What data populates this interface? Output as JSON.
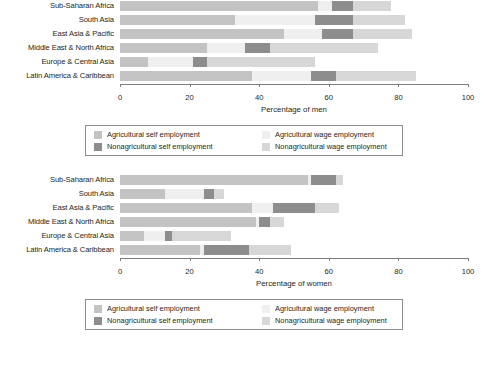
{
  "colors": {
    "ag_self": "#c3c3c3",
    "ag_wage": "#efefef",
    "nonag_self": "#8d8d8d",
    "nonag_wage": "#d7d7d7",
    "axis": "#7d7d7d",
    "text": "#231f20",
    "legend_border": "#8d8d8d"
  },
  "legend": {
    "items": [
      {
        "key": "ag_self",
        "label": "Agricultural self employment"
      },
      {
        "key": "ag_wage",
        "label": "Agricultural wage employment"
      },
      {
        "key": "nonag_self",
        "label": "Nonagricultural self employment"
      },
      {
        "key": "nonag_wage",
        "label": "Nonagricultural wage employment"
      }
    ]
  },
  "chart_data": [
    {
      "type": "bar",
      "orientation": "horizontal",
      "stacked": true,
      "title": "",
      "xlabel": "Percentage of men",
      "ylabel": "",
      "xlim": [
        0,
        100
      ],
      "xticks": [
        0,
        20,
        40,
        60,
        80,
        100
      ],
      "grid": false,
      "legend_position": "below",
      "categories": [
        "Sub-Saharan Africa",
        "South Asia",
        "East Asia & Pacific",
        "Middle East & North Africa",
        "Europe & Central Asia",
        "Latin America & Caribbean"
      ],
      "series": [
        {
          "name": "Agricultural self employment",
          "values": [
            57,
            33,
            47,
            25,
            8,
            38
          ]
        },
        {
          "name": "Agricultural wage employment",
          "values": [
            4,
            23,
            11,
            11,
            13,
            17
          ]
        },
        {
          "name": "Nonagricultural self employment",
          "values": [
            6,
            11,
            9,
            7,
            4,
            7
          ]
        },
        {
          "name": "Nonagricultural wage employment",
          "values": [
            11,
            15,
            17,
            31,
            31,
            23
          ]
        }
      ],
      "totals": [
        78,
        82,
        84,
        74,
        56,
        85
      ]
    },
    {
      "type": "bar",
      "orientation": "horizontal",
      "stacked": true,
      "title": "",
      "xlabel": "Percentage of women",
      "ylabel": "",
      "xlim": [
        0,
        100
      ],
      "xticks": [
        0,
        20,
        40,
        60,
        80,
        100
      ],
      "grid": false,
      "legend_position": "below",
      "categories": [
        "Sub-Saharan Africa",
        "South Asia",
        "East Asia & Pacific",
        "Middle East & North Africa",
        "Europe & Central Asia",
        "Latin America & Caribbean"
      ],
      "series": [
        {
          "name": "Agricultural self employment",
          "values": [
            54,
            13,
            38,
            39,
            7,
            23
          ]
        },
        {
          "name": "Agricultural wage employment",
          "values": [
            1,
            11,
            6,
            1,
            6,
            1
          ]
        },
        {
          "name": "Nonagricultural self employment",
          "values": [
            7,
            3,
            12,
            3,
            2,
            13
          ]
        },
        {
          "name": "Nonagricultural wage employment",
          "values": [
            2,
            3,
            7,
            4,
            17,
            12
          ]
        }
      ],
      "totals": [
        64,
        30,
        63,
        47,
        32,
        49
      ]
    }
  ]
}
